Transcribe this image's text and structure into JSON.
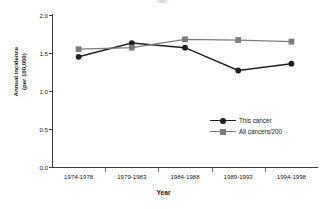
{
  "chart_data": {
    "type": "line",
    "title": "",
    "xlabel": "Year",
    "ylabel": "Annual incidence\n(per 100,000)",
    "categories": [
      "1974-1978",
      "1979-1983",
      "1984-1988",
      "1989-1993",
      "1994-1998"
    ],
    "ylim": [
      0.0,
      2.0
    ],
    "ytick_labels": [
      "0.0",
      "0.5",
      "1.0",
      "1.5",
      "2.0"
    ],
    "ytick_values": [
      0.0,
      0.5,
      1.0,
      1.5,
      2.0
    ],
    "grid": false,
    "legend_position": "center-right-inside",
    "series": [
      {
        "name": "This cancer",
        "marker": "circle",
        "color": "#1f1f1f",
        "values": [
          1.45,
          1.63,
          1.57,
          1.27,
          1.36
        ]
      },
      {
        "name": "All cancers/200",
        "marker": "square",
        "color": "#7b7b7b",
        "values": [
          1.55,
          1.57,
          1.68,
          1.67,
          1.65
        ]
      }
    ]
  },
  "legend": {
    "items": [
      {
        "label": "This cancer"
      },
      {
        "label": "All cancers/200"
      }
    ]
  },
  "colors": {
    "axis": "#3b3b3b",
    "text": "#161616",
    "series_primary": "#1f1f1f",
    "series_secondary": "#7b7b7b",
    "background": "#ffffff"
  }
}
